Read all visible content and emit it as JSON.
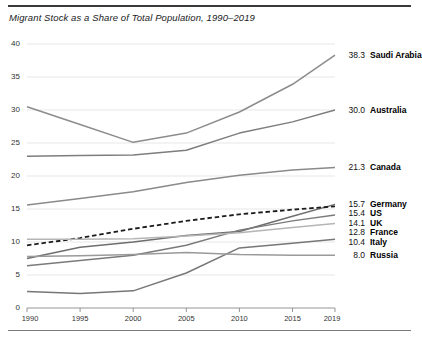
{
  "header": {
    "title": "Migrant Stock as a Share of Total Population, 1990–2019"
  },
  "axis": {
    "y_ticks": [
      "0",
      "5",
      "10",
      "15",
      "20",
      "25",
      "30",
      "35",
      "40"
    ],
    "x_ticks": [
      "1990",
      "1995",
      "2000",
      "2005",
      "2010",
      "2015",
      "2019"
    ]
  },
  "legend": [
    {
      "value": "38.3",
      "name": "Saudi Arabia"
    },
    {
      "value": "30.0",
      "name": "Australia"
    },
    {
      "value": "21.3",
      "name": "Canada"
    },
    {
      "value": "15.7",
      "name": "Germany"
    },
    {
      "value": "15.4",
      "name": "US"
    },
    {
      "value": "14.1",
      "name": "UK"
    },
    {
      "value": "12.8",
      "name": "France"
    },
    {
      "value": "10.4",
      "name": "Italy"
    },
    {
      "value": "8.0",
      "name": "Russia"
    }
  ],
  "chart_data": {
    "type": "line",
    "title": "Migrant Stock as a Share of Total Population, 1990–2019",
    "xlabel": "",
    "ylabel": "",
    "x": [
      1990,
      1995,
      2000,
      2005,
      2010,
      2015,
      2019
    ],
    "xlim": [
      1990,
      2019
    ],
    "ylim": [
      0,
      40
    ],
    "grid": true,
    "legend_position": "right-inline-end-labels",
    "series": [
      {
        "name": "Saudi Arabia",
        "end_value": 38.3,
        "color": "#8c8c8c",
        "style": "solid",
        "values": [
          30.5,
          27.8,
          25.1,
          26.5,
          29.7,
          33.9,
          38.3
        ]
      },
      {
        "name": "Australia",
        "end_value": 30.0,
        "color": "#7d7d7d",
        "style": "solid",
        "values": [
          23.0,
          23.1,
          23.2,
          23.9,
          26.5,
          28.2,
          30.0
        ]
      },
      {
        "name": "Canada",
        "end_value": 21.3,
        "color": "#8a8a8a",
        "style": "solid",
        "values": [
          15.6,
          16.6,
          17.6,
          19.0,
          20.1,
          20.9,
          21.3
        ]
      },
      {
        "name": "Germany",
        "end_value": 15.7,
        "color": "#6e6e6e",
        "style": "solid",
        "values": [
          7.5,
          9.2,
          10.0,
          11.0,
          11.6,
          13.9,
          15.7
        ]
      },
      {
        "name": "US",
        "end_value": 15.4,
        "color": "#1c1c1c",
        "style": "dashed",
        "values": [
          9.5,
          10.6,
          12.0,
          13.2,
          14.2,
          14.9,
          15.4
        ]
      },
      {
        "name": "UK",
        "end_value": 14.1,
        "color": "#7a7a7a",
        "style": "solid",
        "values": [
          6.4,
          7.2,
          8.0,
          9.5,
          11.8,
          13.2,
          14.1
        ]
      },
      {
        "name": "France",
        "end_value": 12.8,
        "color": "#b5b5b5",
        "style": "solid",
        "values": [
          10.4,
          10.4,
          10.5,
          10.9,
          11.4,
          12.2,
          12.8
        ]
      },
      {
        "name": "Italy",
        "end_value": 10.4,
        "color": "#777777",
        "style": "solid",
        "values": [
          2.5,
          2.2,
          2.6,
          5.3,
          9.1,
          9.8,
          10.4
        ]
      },
      {
        "name": "Russia",
        "end_value": 8.0,
        "color": "#9a9a9a",
        "style": "solid",
        "values": [
          7.8,
          7.9,
          8.1,
          8.4,
          8.1,
          8.0,
          8.0
        ]
      }
    ]
  }
}
